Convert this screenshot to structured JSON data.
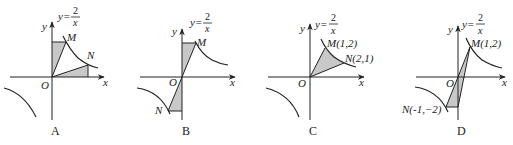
{
  "colors": {
    "ink": "#222222",
    "shade": "#c8c8c8",
    "background": "#ffffff"
  },
  "function_label": {
    "lhs": "y=",
    "numerator": "2",
    "denominator": "x"
  },
  "axis_labels": {
    "x": "x",
    "y": "y",
    "origin": "O"
  },
  "panels": [
    {
      "id": "A",
      "caption": "A",
      "points": [
        {
          "name": "M",
          "label": "M"
        },
        {
          "name": "N",
          "label": "N"
        }
      ],
      "description": "Rectangle under M to y-axis and rectangle under N to x-axis shaded, with segments OM and ON"
    },
    {
      "id": "B",
      "caption": "B",
      "points": [
        {
          "name": "M",
          "label": "M"
        },
        {
          "name": "N",
          "label": "N"
        }
      ],
      "description": "Triangles between segment MN through O and the y-axis shaded"
    },
    {
      "id": "C",
      "caption": "C",
      "points": [
        {
          "name": "M",
          "label": "M(1,2)"
        },
        {
          "name": "N",
          "label": "N(2,1)"
        }
      ],
      "description": "Region bounded by OM, curve MN and ON shaded"
    },
    {
      "id": "D",
      "caption": "D",
      "points": [
        {
          "name": "M",
          "label": "M(1,2)"
        },
        {
          "name": "N",
          "label": "N(-1,−2)"
        }
      ],
      "description": "Triangle N, M and foot on y-axis shaded"
    }
  ]
}
